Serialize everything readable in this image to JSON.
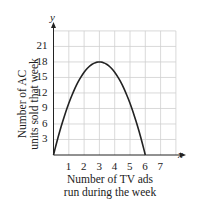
{
  "chart_data": {
    "type": "line",
    "title": "",
    "xlabel": "Number of TV ads run during the week",
    "ylabel": "Number of AC units sold that week",
    "xlabel_lines": [
      "Number of TV ads",
      "run during the week"
    ],
    "ylabel_lines": [
      "Number of AC",
      "units sold that week"
    ],
    "x_axis_letter": "x",
    "y_axis_letter": "y",
    "x_ticks": [
      "1",
      "2",
      "3",
      "4",
      "5",
      "6",
      "7"
    ],
    "y_ticks": [
      "3",
      "6",
      "9",
      "12",
      "15",
      "18",
      "21"
    ],
    "xlim": [
      0,
      8
    ],
    "ylim": [
      0,
      24
    ],
    "grid": true,
    "legend": null,
    "series": [
      {
        "name": "AC units sold",
        "function": "y = -2x^2 + 12x",
        "x": [
          0,
          0.5,
          1,
          1.5,
          2,
          2.5,
          3,
          3.5,
          4,
          4.5,
          5,
          5.5,
          6
        ],
        "y": [
          0,
          5.5,
          10,
          13.5,
          16,
          17.5,
          18,
          17.5,
          16,
          13.5,
          10,
          5.5,
          0
        ]
      }
    ],
    "vertex": {
      "x": 3,
      "y": 18
    }
  }
}
